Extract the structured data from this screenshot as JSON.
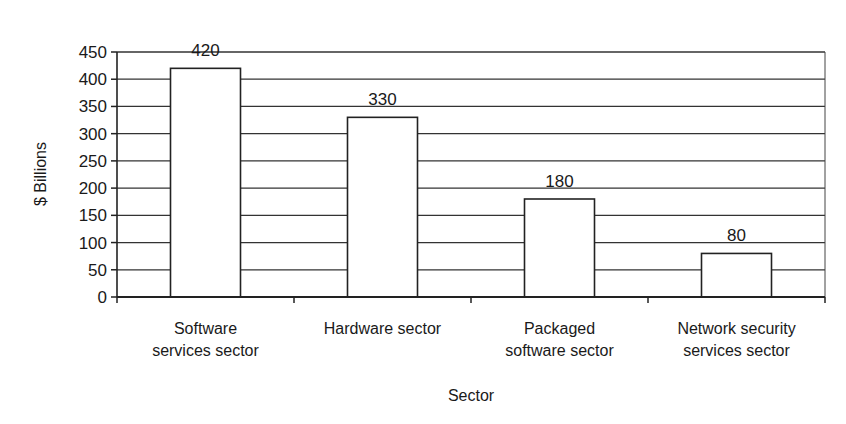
{
  "chart_data": {
    "type": "bar",
    "title": "",
    "xlabel": "Sector",
    "ylabel": "$ Billions",
    "categories": [
      [
        "Software",
        "services sector"
      ],
      [
        "Hardware sector"
      ],
      [
        "Packaged",
        "software sector"
      ],
      [
        "Network security",
        "services sector"
      ]
    ],
    "category_names": [
      "Software services sector",
      "Hardware sector",
      "Packaged software sector",
      "Network security services sector"
    ],
    "values": [
      420,
      330,
      180,
      80
    ],
    "data_labels": [
      "420",
      "330",
      "180",
      "80"
    ],
    "ylim": [
      0,
      450
    ],
    "yticks": [
      0,
      50,
      100,
      150,
      200,
      250,
      300,
      350,
      400,
      450
    ],
    "grid": true,
    "legend": null,
    "colors": {
      "bar_fill": "#ffffff",
      "bar_stroke": "#222222",
      "grid": "#333333"
    }
  }
}
